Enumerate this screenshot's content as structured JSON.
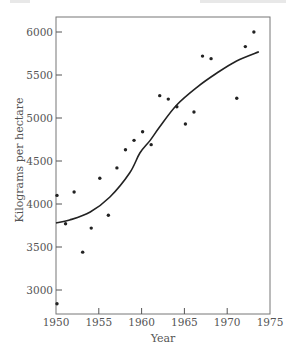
{
  "chart_data": {
    "type": "scatter",
    "title": "",
    "xlabel": "Year",
    "ylabel": "Kilograms per hectare",
    "xlim": [
      1950,
      1975
    ],
    "ylim": [
      2750,
      6200
    ],
    "x_ticks": [
      1950,
      1955,
      1960,
      1965,
      1970,
      1975
    ],
    "x_tick_labels": [
      "1950",
      "1955",
      "1960",
      "1965",
      "1970",
      "1975"
    ],
    "y_ticks": [
      3000,
      3500,
      4000,
      4500,
      5000,
      5500,
      6000
    ],
    "y_tick_labels": [
      "3000",
      "3500",
      "4000",
      "4500",
      "5000",
      "5500",
      "6000"
    ],
    "grid": false,
    "legend": null,
    "series": [
      {
        "name": "Observed yield",
        "kind": "scatter",
        "points": [
          {
            "x": 1950,
            "y": 2840
          },
          {
            "x": 1950,
            "y": 4100
          },
          {
            "x": 1951,
            "y": 3770
          },
          {
            "x": 1952,
            "y": 4140
          },
          {
            "x": 1953,
            "y": 3440
          },
          {
            "x": 1954,
            "y": 3720
          },
          {
            "x": 1955,
            "y": 4300
          },
          {
            "x": 1956,
            "y": 3870
          },
          {
            "x": 1957,
            "y": 4420
          },
          {
            "x": 1958,
            "y": 4630
          },
          {
            "x": 1959,
            "y": 4740
          },
          {
            "x": 1960,
            "y": 4840
          },
          {
            "x": 1961,
            "y": 4690
          },
          {
            "x": 1962,
            "y": 5260
          },
          {
            "x": 1963,
            "y": 5220
          },
          {
            "x": 1964,
            "y": 5130
          },
          {
            "x": 1965,
            "y": 4930
          },
          {
            "x": 1966,
            "y": 5070
          },
          {
            "x": 1967,
            "y": 5720
          },
          {
            "x": 1968,
            "y": 5690
          },
          {
            "x": 1971,
            "y": 5230
          },
          {
            "x": 1972,
            "y": 5830
          },
          {
            "x": 1973,
            "y": 6000
          }
        ]
      },
      {
        "name": "Fitted logistic trend",
        "kind": "line",
        "points": [
          {
            "x": 1950,
            "y": 3780
          },
          {
            "x": 1951.6,
            "y": 3814
          },
          {
            "x": 1954,
            "y": 3907
          },
          {
            "x": 1956.3,
            "y": 4081
          },
          {
            "x": 1958.6,
            "y": 4360
          },
          {
            "x": 1959.8,
            "y": 4593
          },
          {
            "x": 1961,
            "y": 4740
          },
          {
            "x": 1962.1,
            "y": 4895
          },
          {
            "x": 1964.1,
            "y": 5151
          },
          {
            "x": 1966.5,
            "y": 5360
          },
          {
            "x": 1968.8,
            "y": 5523
          },
          {
            "x": 1971.1,
            "y": 5663
          },
          {
            "x": 1973.7,
            "y": 5770
          }
        ]
      }
    ]
  },
  "layout_px": {
    "plot_left": 56,
    "plot_right": 270,
    "plot_top": 17,
    "plot_bottom": 314,
    "x0_year": 1950,
    "px_per_year": 8.56,
    "y_ref_value": 6000,
    "y_ref_px": 32,
    "px_per_unit": 0.086
  }
}
